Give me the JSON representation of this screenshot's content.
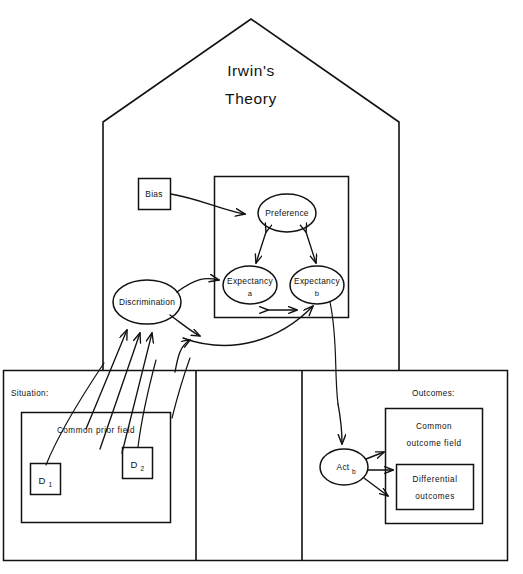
{
  "figure": {
    "title_line1": "Irwin's",
    "title_line2": "Theory"
  },
  "house": {
    "bias_box": {
      "label": "Bias"
    },
    "inner_frame": {
      "label": ""
    },
    "nodes": {
      "preference": {
        "label": "Preference"
      },
      "expectancy_a": {
        "label": "Expectancy",
        "sub": "a"
      },
      "expectancy_b": {
        "label": "Expectancy",
        "sub": "b"
      },
      "discrimination": {
        "label": "Discrimination"
      }
    }
  },
  "bottom_band": {
    "situation": {
      "heading": "Situation:",
      "common_prior_field": "Common prior field",
      "d1": {
        "letter": "D",
        "sub": "1"
      },
      "d2": {
        "letter": "D",
        "sub": "2"
      }
    },
    "middle_panel": {
      "label": ""
    },
    "outcomes": {
      "heading": "Outcomes:",
      "common_outcome_field_line1": "Common",
      "common_outcome_field_line2": "outcome field",
      "differential_outcomes_line1": "Differential",
      "differential_outcomes_line2": "outcomes",
      "act_b": {
        "label": "Act",
        "sub": "b"
      }
    }
  },
  "colors": {
    "ink": "#111111",
    "paper": "#ffffff"
  }
}
